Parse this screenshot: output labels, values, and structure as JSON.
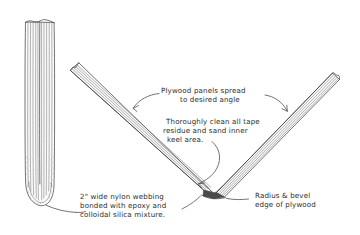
{
  "figure": {
    "background_color": "#ffffff",
    "ink_color": "#3a3a3a",
    "text_color": "#2b2b2b",
    "style": "hand-drawn pencil technical illustration"
  },
  "annotations": {
    "plywood_panels": {
      "line1": "Plywood panels  spread",
      "line2": "to desired angle"
    },
    "clean_keel": {
      "line1": "Thoroughly clean all tape",
      "line2": "residue and sand inner",
      "line3": "keel area."
    },
    "nylon_webbing": {
      "line1": "2\" wide nylon webbing",
      "line2": "bonded  with epoxy and",
      "line3": "colloidal silica mixture."
    },
    "radius_bevel": {
      "line1": "Radius & bevel",
      "line2": "edge of plywood"
    }
  },
  "drawings": {
    "closed_assembly": {
      "name": "two plywood panels closed with rounded keel",
      "position": "left"
    },
    "spread_assembly": {
      "name": "two plywood panels spread into V at keel",
      "position": "right"
    }
  }
}
